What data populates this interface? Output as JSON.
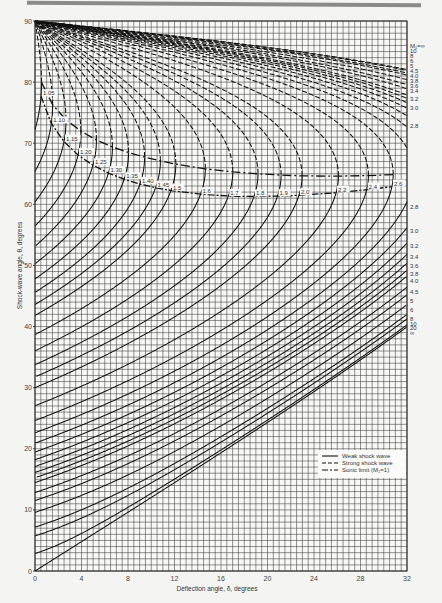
{
  "chart_data": {
    "type": "line",
    "title": "",
    "xlabel": "Deflection angle, δ, degrees",
    "ylabel": "Shock-wave angle, θ, degrees",
    "xlim": [
      0,
      32
    ],
    "ylim": [
      0,
      90
    ],
    "x_ticks": [
      "0",
      "4",
      "8",
      "12",
      "16",
      "20",
      "24",
      "28",
      "32"
    ],
    "y_ticks": [
      "0",
      "10",
      "20",
      "30",
      "40",
      "50",
      "60",
      "70",
      "80",
      "90"
    ],
    "grid": true,
    "grid_minor_x": 0.5,
    "grid_minor_y": 1,
    "legend": {
      "position": "lower right",
      "entries": [
        {
          "label": "Weak shock wave",
          "style": "solid"
        },
        {
          "label": "Strong shock wave",
          "style": "dashed"
        },
        {
          "label": "Sonic limit (M₂=1)",
          "style": "dash-dot"
        }
      ]
    },
    "series_mach_numbers": [
      1.05,
      1.1,
      1.15,
      1.2,
      1.25,
      1.3,
      1.35,
      1.4,
      1.45,
      1.5,
      1.6,
      1.7,
      1.8,
      1.9,
      2.0,
      2.2,
      2.4,
      2.6,
      2.8,
      3.0,
      3.2,
      3.4,
      3.6,
      3.8,
      4.0,
      4.5,
      5,
      6,
      8,
      10,
      20,
      "∞"
    ],
    "mach_labels_on_sonic_line": [
      "1.05",
      "1.10",
      "1.15",
      "1.20",
      "1.25",
      "1.30",
      "1.35",
      "1.40",
      "1.45",
      "1.5",
      "1.6",
      "1.7",
      "1.8",
      "1.9",
      "2.0",
      "2.2",
      "2.4",
      "2.6"
    ],
    "right_labels_strong": [
      "M₁=∞",
      "10",
      "8",
      "6",
      "5",
      "4.5",
      "4.0",
      "3.8",
      "3.6",
      "3.4",
      "3.2",
      "3.0",
      "2.8"
    ],
    "right_labels_weak": [
      "2.8",
      "3.0",
      "3.2",
      "3.4",
      "3.6",
      "3.8",
      "4.0",
      "4.5",
      "5",
      "6",
      "8",
      "10",
      "20",
      "∞"
    ]
  }
}
